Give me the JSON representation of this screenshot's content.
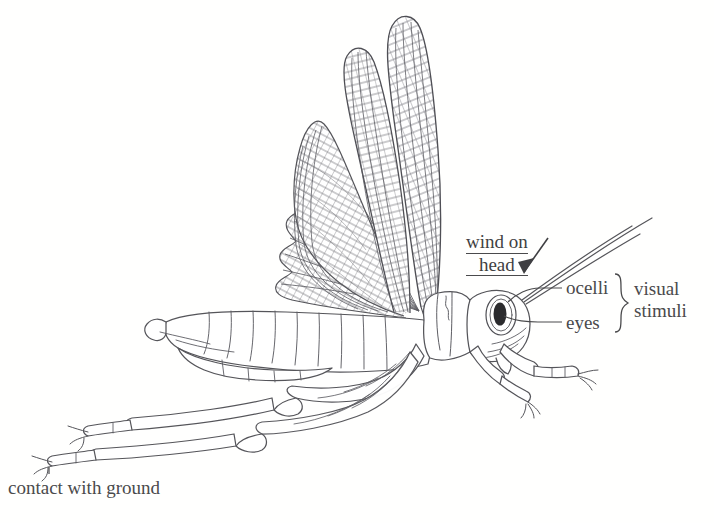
{
  "figure": {
    "kind": "scientific-line-drawing",
    "background_color": "#fffffe",
    "ink_color": "#4a4a4c",
    "line_color": "#55555a"
  },
  "labels": {
    "wind_on_head": {
      "line1": "wind on",
      "line2": "head",
      "underlined": true
    },
    "ocelli": "ocelli",
    "eyes": "eyes",
    "visual_stimuli": {
      "line1": "visual",
      "line2": "stimuli"
    },
    "contact_with_ground": "contact with ground"
  },
  "anatomy": {
    "forewing": "forewing",
    "hindwing": "hindwing",
    "head": "head",
    "pronotum": "pronotum",
    "abdomen": "abdomen",
    "compound_eye": "compound-eye",
    "antenna": "antenna",
    "foreleg": "foreleg",
    "midleg": "midleg",
    "hindleg": "hindleg",
    "tarsus": "tarsus"
  },
  "annotations": {
    "arrow": "wind-direction-arrow",
    "leader_ocelli": "leader-line-ocelli",
    "leader_eyes": "leader-line-eyes",
    "leader_ground": "leader-line-ground",
    "brace": "grouping-brace"
  }
}
